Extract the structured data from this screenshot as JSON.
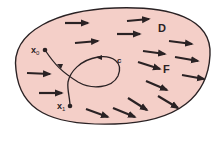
{
  "diagram": {
    "region": {
      "label": "D",
      "fill": "#f4cfc8",
      "stroke": "#2a2224"
    },
    "field": {
      "label": "F",
      "arrow_color": "#2a2224"
    },
    "curve": {
      "label": "C",
      "color": "#2a2224"
    },
    "points": {
      "start": {
        "label": "x",
        "subscript": "0"
      },
      "end": {
        "label": "x",
        "subscript": "1"
      }
    }
  }
}
